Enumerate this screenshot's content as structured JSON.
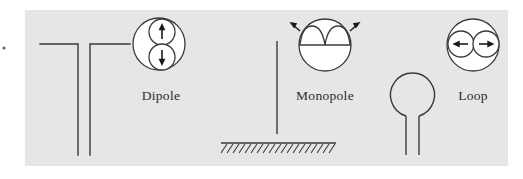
{
  "figure": {
    "background_color": "#ffffff",
    "panel_color": "#e6e6e6",
    "line_color": "#3a3a3a",
    "pattern_fill": "#ffffff",
    "label_color": "#2b2b2b"
  },
  "antennas": [
    {
      "id": "dipole",
      "label": "Dipole",
      "element_icon": "dipole-antenna-icon",
      "pattern_icon": "dipole-radiation-pattern-icon",
      "pattern_type": "figure-eight-vertical",
      "arrows": [
        "up-arrow",
        "down-arrow"
      ],
      "lobe_count": 2
    },
    {
      "id": "monopole",
      "label": "Monopole",
      "element_icon": "monopole-antenna-icon",
      "pattern_icon": "monopole-radiation-pattern-icon",
      "pattern_type": "hemispherical-lobes-over-ground",
      "arrows": [
        "up-left-arrow",
        "up-right-arrow"
      ],
      "lobe_count": 2,
      "ground_plane_icon": "ground-plane-hatch-icon"
    },
    {
      "id": "loop",
      "label": "Loop",
      "element_icon": "loop-antenna-icon",
      "pattern_icon": "loop-radiation-pattern-icon",
      "pattern_type": "figure-eight-horizontal",
      "arrows": [
        "left-arrow",
        "right-arrow"
      ],
      "lobe_count": 2
    }
  ]
}
